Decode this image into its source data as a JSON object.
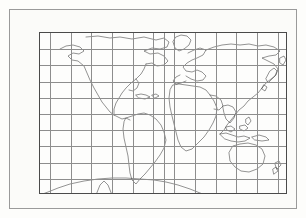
{
  "figure": {
    "title_visible": false,
    "colors": {
      "background": "#fdfdfb",
      "grid": "#8d8d8d",
      "coastline": "#3a3a3a",
      "axis": "#4a4a4a",
      "marker": "#111111"
    }
  },
  "chart_data": {
    "type": "scatter",
    "title": "",
    "xlabel": "",
    "ylabel": "",
    "projection": "equirectangular world map",
    "grid": true,
    "legend": "none",
    "xlim": [
      -180,
      180
    ],
    "ylim": [
      -75,
      75
    ],
    "x_tick_labels_top": [
      "165",
      "135",
      "105",
      "75",
      "45",
      "15",
      "15",
      "45",
      "75",
      "105",
      "135",
      "165"
    ],
    "x_tick_values_top": [
      -165,
      -135,
      -105,
      -75,
      -45,
      -15,
      15,
      45,
      75,
      105,
      135,
      165
    ],
    "x_tick_labels_bottom": [
      "180",
      "150",
      "120",
      "90",
      "60",
      "30",
      "0",
      "30",
      "60",
      "90",
      "120",
      "150",
      "180"
    ],
    "x_tick_values_bottom": [
      -180,
      -150,
      -120,
      -90,
      -60,
      -30,
      0,
      30,
      60,
      90,
      120,
      150,
      180
    ],
    "y_tick_labels": [
      "75",
      "60",
      "45",
      "30",
      "15",
      "0",
      "15",
      "30",
      "45",
      "60",
      "75"
    ],
    "y_tick_values": [
      75,
      60,
      45,
      30,
      15,
      0,
      -15,
      -30,
      -45,
      -60,
      -75
    ],
    "annotations": [
      {
        "text": "NORTH",
        "lon": -4,
        "lat": 69
      },
      {
        "text": "WEST",
        "lon": -111,
        "lat": -59
      },
      {
        "text": "EAST",
        "lon": 93,
        "lat": -59
      },
      {
        "text": "SOUTH",
        "lon": 28,
        "lat": -69
      }
    ],
    "points": [
      {
        "label": "1",
        "lon": -150,
        "lat": 61,
        "label_dx": 2,
        "label_dy": -4
      },
      {
        "label": "2",
        "lon": -122,
        "lat": 45,
        "label_dx": 4,
        "label_dy": -3
      },
      {
        "label": "3",
        "lon": 37,
        "lat": 36,
        "label_dx": 4,
        "label_dy": -2
      },
      {
        "label": "4",
        "lon": -110,
        "lat": 29,
        "label_dx": 3,
        "label_dy": -4
      },
      {
        "label": "5",
        "lon": 66,
        "lat": 30,
        "label_dx": 4,
        "label_dy": -2
      },
      {
        "label": "6",
        "lon": -79,
        "lat": 20,
        "label_dx": 4,
        "label_dy": -2
      },
      {
        "label": "7",
        "lon": 162,
        "lat": 57,
        "label_dx": 5,
        "label_dy": 0
      },
      {
        "label": "8",
        "lon": 144,
        "lat": 43,
        "label_dx": 5,
        "label_dy": 0
      },
      {
        "label": "9",
        "lon": 105,
        "lat": 18,
        "label_dx": 1,
        "label_dy": -4
      },
      {
        "label": "10",
        "lon": -101,
        "lat": 15,
        "label_dx": -6,
        "label_dy": 3
      },
      {
        "label": "11",
        "lon": 102,
        "lat": -3,
        "label_dx": -5,
        "label_dy": 2
      },
      {
        "label": "12",
        "lon": 152,
        "lat": 0,
        "label_dx": 5,
        "label_dy": -3
      },
      {
        "label": "13",
        "lon": -79,
        "lat": 0,
        "label_dx": 5,
        "label_dy": 1
      },
      {
        "label": "14",
        "lon": -71,
        "lat": -30,
        "label_dx": -5,
        "label_dy": -1
      },
      {
        "label": "15",
        "lon": -72,
        "lat": -53,
        "label_dx": -5,
        "label_dy": 0
      }
    ]
  }
}
